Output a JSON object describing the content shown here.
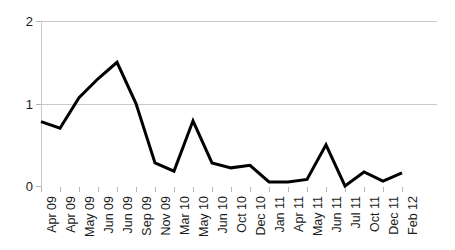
{
  "chart_data": {
    "type": "line",
    "title": "",
    "subtitle": "",
    "xlabel": "",
    "ylabel": "",
    "ylim": [
      0,
      2
    ],
    "yticks": [
      0,
      1,
      2
    ],
    "ytick_labels": [
      "0",
      "1",
      "2"
    ],
    "grid": true,
    "gridlines_at": [
      1,
      2
    ],
    "legend": false,
    "legend_position": "none",
    "line_color": "#000000",
    "line_width": 3,
    "gridline_color": "#c9c9c9",
    "background_color": "#ffffff",
    "categories": [
      "Apr 09",
      "Apr 09",
      "May 09",
      "Jun 09",
      "Jun 09",
      "Sep 09",
      "Nov 09",
      "Mar 10",
      "May 10",
      "Jun 10",
      "Oct 10",
      "Dec 10",
      "Jan 11",
      "Apr 11",
      "May 11",
      "Jun 11",
      "Jul 11",
      "Oct 11",
      "Dec 11",
      "Feb 12"
    ],
    "values": [
      0.78,
      0.7,
      1.07,
      1.3,
      1.5,
      1.0,
      0.28,
      0.18,
      0.79,
      0.28,
      0.22,
      0.25,
      0.05,
      0.05,
      0.08,
      0.5,
      0.0,
      0.17,
      0.06,
      0.16
    ],
    "series": [
      {
        "name": "",
        "values": [
          0.78,
          0.7,
          1.07,
          1.3,
          1.5,
          1.0,
          0.28,
          0.18,
          0.79,
          0.28,
          0.22,
          0.25,
          0.05,
          0.05,
          0.08,
          0.5,
          0.0,
          0.17,
          0.06,
          0.16
        ]
      }
    ],
    "annotations": []
  }
}
